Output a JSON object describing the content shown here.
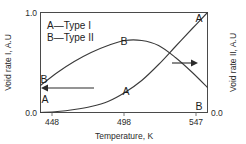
{
  "chart_data": {
    "type": "line",
    "title": "",
    "xlabel": "Temperature, K",
    "ylabel": "Void rate I, A.U",
    "y2label": "Void rate II, A.U",
    "xlim": [
      448,
      547
    ],
    "ylim": [
      0.0,
      1.0
    ],
    "y2lim": [
      0.0,
      1.0
    ],
    "grid": false,
    "legend_position": "top-left-inside",
    "xticks": [
      "448",
      "498",
      "547"
    ],
    "xtick_values": [
      448,
      498,
      547
    ],
    "yticks": [
      "1.0",
      "0.0"
    ],
    "ytick_values": [
      1.0,
      0.0
    ],
    "y2ticks": [
      "0.0"
    ],
    "y2tick_values": [
      0.0
    ],
    "legend": [
      {
        "key": "A",
        "dash": "—",
        "label": "Type I"
      },
      {
        "key": "B",
        "dash": "—",
        "label": "Type II"
      }
    ],
    "series": [
      {
        "name": "A",
        "legend_label": "Type I",
        "axis": "left",
        "axis_arrow_direction": "left",
        "x": [
          448,
          458,
          468,
          478,
          488,
          498,
          508,
          518,
          528,
          538,
          547
        ],
        "values": [
          0.0,
          0.01,
          0.03,
          0.06,
          0.11,
          0.2,
          0.32,
          0.48,
          0.66,
          0.84,
          1.0
        ]
      },
      {
        "name": "B",
        "legend_label": "Type II",
        "axis": "right",
        "axis_arrow_direction": "right",
        "x": [
          448,
          458,
          468,
          478,
          488,
          498,
          508,
          518,
          528,
          538,
          547
        ],
        "values": [
          0.27,
          0.4,
          0.51,
          0.6,
          0.67,
          0.72,
          0.72,
          0.67,
          0.55,
          0.4,
          0.25
        ]
      }
    ],
    "point_labels": [
      {
        "series": "A",
        "text": "A",
        "x": 448,
        "y": 0.12,
        "anchor": "bottom-left"
      },
      {
        "series": "A",
        "text": "A",
        "x": 498,
        "y": 0.2,
        "anchor": "curve"
      },
      {
        "series": "A",
        "text": "A",
        "x": 547,
        "y": 1.0,
        "anchor": "top-right"
      },
      {
        "series": "B",
        "text": "B",
        "x": 448,
        "y": 0.27,
        "anchor": "curve"
      },
      {
        "series": "B",
        "text": "B",
        "x": 498,
        "y": 0.72,
        "anchor": "curve"
      },
      {
        "series": "B",
        "text": "B",
        "x": 547,
        "y": 0.02,
        "anchor": "bottom-right"
      }
    ],
    "annotations": [
      {
        "name": "left-axis-arrow",
        "direction": "left",
        "meaning": "series A reads left axis"
      },
      {
        "name": "right-axis-arrow",
        "direction": "right",
        "meaning": "series B reads right axis"
      }
    ],
    "colors": {
      "curve": "#3a3a3a",
      "frame": "#4a4a4a",
      "text": "#2b2b2b",
      "background": "#ffffff"
    }
  }
}
